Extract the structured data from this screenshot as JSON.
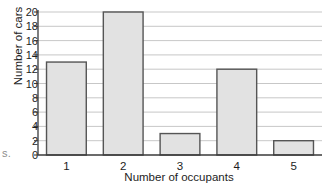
{
  "chart_data": {
    "type": "bar",
    "title": "",
    "xlabel": "Number of occupants",
    "ylabel": "Number of cars",
    "categories": [
      "1",
      "2",
      "3",
      "4",
      "5"
    ],
    "values": [
      13,
      20,
      3,
      12,
      2
    ],
    "series": [
      {
        "name": "Number of cars",
        "values": [
          13,
          20,
          3,
          12,
          2
        ]
      }
    ],
    "ylim": [
      0,
      20
    ],
    "xlim": [
      0,
      5
    ],
    "y_ticks": [
      0,
      2,
      4,
      6,
      8,
      10,
      12,
      14,
      16,
      18,
      20
    ],
    "y_tick_labels": [
      "0",
      "2",
      "4",
      "6",
      "8",
      "10",
      "12",
      "14",
      "16",
      "18",
      "20"
    ],
    "x_tick_labels": [
      "1",
      "2",
      "3",
      "4",
      "5"
    ],
    "grid": "horizontal",
    "legend": "none",
    "bar_fill_color": "#e2e2e2",
    "bar_edge_color": "#555555",
    "grid_color": "#b9b9b9",
    "axis_color": "#3a3a3a"
  },
  "annotations": {
    "margin_artifact": "s."
  }
}
